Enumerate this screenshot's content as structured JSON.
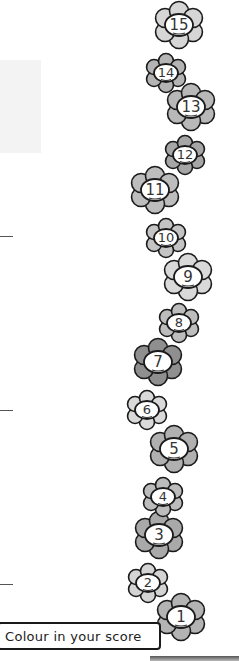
{
  "worksheet": {
    "instruction": "Colour in your score",
    "score_flowers": [
      {
        "number": "15",
        "cx": 179,
        "cy": 25,
        "size": "large",
        "fill": "#d6d6d6"
      },
      {
        "number": "14",
        "cx": 166,
        "cy": 73,
        "size": "small",
        "fill": "#b4b4b4"
      },
      {
        "number": "13",
        "cx": 191,
        "cy": 107,
        "size": "large",
        "fill": "#b8b8b8"
      },
      {
        "number": "12",
        "cx": 185,
        "cy": 155,
        "size": "small",
        "fill": "#a6a6a6"
      },
      {
        "number": "11",
        "cx": 155,
        "cy": 190,
        "size": "large",
        "fill": "#bdbdbd"
      },
      {
        "number": "10",
        "cx": 166,
        "cy": 238,
        "size": "small",
        "fill": "#c4c4c4"
      },
      {
        "number": "9",
        "cx": 188,
        "cy": 277,
        "size": "large",
        "fill": "#d9d9d9"
      },
      {
        "number": "8",
        "cx": 179,
        "cy": 323,
        "size": "small",
        "fill": "#bdbdbd"
      },
      {
        "number": "7",
        "cx": 158,
        "cy": 362,
        "size": "large",
        "fill": "#8f8f8f"
      },
      {
        "number": "6",
        "cx": 147,
        "cy": 410,
        "size": "small",
        "fill": "#d9d9d9"
      },
      {
        "number": "5",
        "cx": 174,
        "cy": 449,
        "size": "large",
        "fill": "#b0b0b0"
      },
      {
        "number": "4",
        "cx": 163,
        "cy": 497,
        "size": "small",
        "fill": "#bcbcbc"
      },
      {
        "number": "3",
        "cx": 159,
        "cy": 535,
        "size": "large",
        "fill": "#a9a9a9"
      },
      {
        "number": "2",
        "cx": 148,
        "cy": 583,
        "size": "small",
        "fill": "#d4d4d4"
      },
      {
        "number": "1",
        "cx": 181,
        "cy": 617,
        "size": "large",
        "fill": "#b3b3b3"
      }
    ],
    "answer_rules_y": [
      236,
      410,
      584
    ]
  }
}
